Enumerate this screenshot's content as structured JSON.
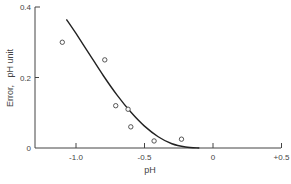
{
  "chart_data": {
    "type": "scatter",
    "title": "",
    "xlabel": "pH",
    "ylabel": "Error,   pH unit",
    "xlim": [
      -1.3,
      0.5
    ],
    "ylim": [
      0,
      0.4
    ],
    "x_ticks": [
      {
        "value": -1.0,
        "label": "-1.0"
      },
      {
        "value": -0.5,
        "label": "-0.5"
      },
      {
        "value": 0,
        "label": "0"
      },
      {
        "value": 0.5,
        "label": "+0.5"
      }
    ],
    "y_ticks": [
      {
        "value": 0,
        "label": "0"
      },
      {
        "value": 0.2,
        "label": "0.2"
      },
      {
        "value": 0.4,
        "label": "0.4"
      }
    ],
    "grid": false,
    "legend": null,
    "series": [
      {
        "name": "measured",
        "type": "scatter",
        "marker": "open-circle",
        "x": [
          -1.1,
          -0.79,
          -0.71,
          -0.62,
          -0.6,
          -0.43,
          -0.23
        ],
        "y": [
          0.3,
          0.25,
          0.12,
          0.11,
          0.06,
          0.02,
          0.025
        ]
      },
      {
        "name": "fitted curve",
        "type": "line",
        "x": [
          -1.07,
          -1.0,
          -0.9,
          -0.8,
          -0.7,
          -0.6,
          -0.5,
          -0.4,
          -0.3,
          -0.2,
          -0.1
        ],
        "y": [
          0.365,
          0.325,
          0.265,
          0.205,
          0.15,
          0.102,
          0.062,
          0.032,
          0.012,
          0.003,
          0.0
        ]
      }
    ]
  }
}
